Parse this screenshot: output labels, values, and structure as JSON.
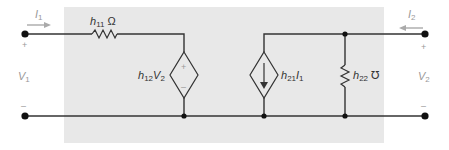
{
  "diagram": {
    "type": "h-parameter two-port equivalent circuit",
    "colors": {
      "background": "#ffffff",
      "box_fill": "#e8e8e8",
      "wire": "#333333",
      "arrow": "#999999",
      "terminal_label": "#999999"
    },
    "port1": {
      "current": {
        "var": "I",
        "sub": "1"
      },
      "voltage": {
        "var": "V",
        "sub": "1"
      },
      "plus": "+",
      "minus": "–"
    },
    "port2": {
      "current": {
        "var": "I",
        "sub": "2"
      },
      "voltage": {
        "var": "V",
        "sub": "2"
      },
      "plus": "+",
      "minus": "–"
    },
    "elements": {
      "h11": {
        "var": "h",
        "sub": "11",
        "unit": " Ω"
      },
      "h12": {
        "var": "h",
        "sub": "12",
        "dep_var": "V",
        "dep_sub": "2",
        "plus": "+",
        "minus": "–"
      },
      "h21": {
        "var": "h",
        "sub": "21",
        "dep_var": "I",
        "dep_sub": "1"
      },
      "h22": {
        "var": "h",
        "sub": "22",
        "unit": " ℧"
      }
    }
  }
}
